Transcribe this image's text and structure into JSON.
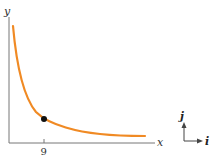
{
  "diagram": {
    "axes": {
      "x_label": "x",
      "y_label": "y",
      "color": "#666666"
    },
    "curve": {
      "description": "decreasing hyperbola-like curve",
      "color": "#f08a24"
    },
    "point": {
      "x_tick_label": "9",
      "color": "#111111"
    },
    "basis": {
      "i_label": "i",
      "j_label": "j",
      "color": "#333333"
    }
  }
}
